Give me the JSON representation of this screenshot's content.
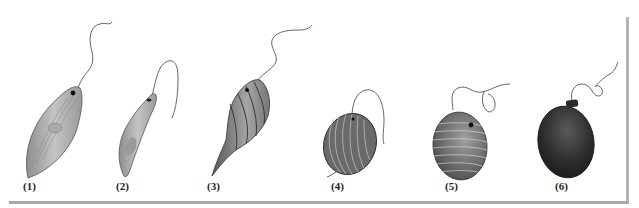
{
  "figure": {
    "organisms": [
      {
        "label": "(1)",
        "shape": "elongate spindle",
        "x": 23
      },
      {
        "label": "(2)",
        "shape": "curved cylinder",
        "x": 116
      },
      {
        "label": "(3)",
        "shape": "spirally striated with tail",
        "x": 207
      },
      {
        "label": "(4)",
        "shape": "ovoid, striated",
        "x": 331
      },
      {
        "label": "(5)",
        "shape": "oval, transversely striated",
        "x": 445
      },
      {
        "label": "(6)",
        "shape": "dark oval with collar",
        "x": 555
      }
    ],
    "colors": {
      "background": "#ffffff",
      "frame": "#aaaaaa",
      "body_light": "#b9b9b9",
      "body_dark": "#3a3a3a"
    }
  }
}
